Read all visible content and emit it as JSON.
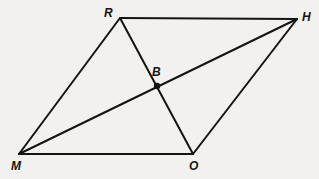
{
  "figure": {
    "kind": "geometry-diagram",
    "shape_name": "parallelogram",
    "width": 319,
    "height": 179,
    "background_color": "#f2f1ef",
    "stroke_color": "#141414",
    "stroke_width": 2,
    "label_color": "#141414"
  },
  "points": {
    "R": {
      "label": "R",
      "x": 120,
      "y": 18,
      "label_x": 104,
      "label_y": 7,
      "type": "vertex"
    },
    "H": {
      "label": "H",
      "x": 297,
      "y": 19,
      "label_x": 302,
      "label_y": 11,
      "type": "vertex"
    },
    "M": {
      "label": "M",
      "x": 19,
      "y": 154,
      "label_x": 11,
      "label_y": 160,
      "type": "vertex"
    },
    "O": {
      "label": "O",
      "x": 193,
      "y": 154,
      "label_x": 189,
      "label_y": 160,
      "type": "vertex"
    },
    "B": {
      "label": "B",
      "x": 157,
      "y": 86,
      "label_x": 152,
      "label_y": 66,
      "type": "intersection"
    }
  },
  "segments": [
    {
      "name": "side-MR",
      "from": "M",
      "to": "R",
      "role": "side"
    },
    {
      "name": "side-RH",
      "from": "R",
      "to": "H",
      "role": "side"
    },
    {
      "name": "side-HO",
      "from": "H",
      "to": "O",
      "role": "side"
    },
    {
      "name": "side-OM",
      "from": "O",
      "to": "M",
      "role": "side"
    },
    {
      "name": "diagonal-RO",
      "from": "R",
      "to": "O",
      "role": "diagonal"
    },
    {
      "name": "diagonal-MH",
      "from": "M",
      "to": "H",
      "role": "diagonal"
    }
  ],
  "markers": [
    {
      "name": "intersection-dot-B",
      "at": "B",
      "radius": 3.2
    }
  ]
}
